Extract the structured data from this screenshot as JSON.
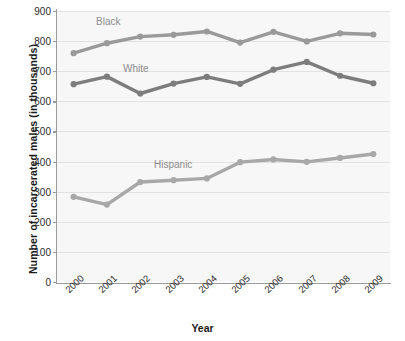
{
  "chart_data": {
    "type": "line",
    "title": "",
    "xlabel": "Year",
    "ylabel": "Number of incarcerated males (in thousands)",
    "categories": [
      "2000",
      "2001",
      "2002",
      "2003",
      "2004",
      "2005",
      "2006",
      "2007",
      "2008",
      "2009"
    ],
    "ylim": [
      0,
      900
    ],
    "ytick_labels": [
      "900",
      "800",
      "700",
      "600",
      "500",
      "400",
      "300",
      "200",
      "100",
      "0"
    ],
    "ytick_values": [
      900,
      800,
      700,
      600,
      500,
      400,
      300,
      200,
      100,
      0
    ],
    "grid": true,
    "legend_position": "inline-labels",
    "series": [
      {
        "name": "Black",
        "color": "#9a9a9a",
        "values": [
          760,
          793,
          815,
          821,
          832,
          795,
          831,
          799,
          826,
          822
        ],
        "label_x": 96,
        "label_y": 16
      },
      {
        "name": "White",
        "color": "#7d7d7d",
        "values": [
          657,
          682,
          626,
          659,
          681,
          658,
          705,
          731,
          685,
          660
        ],
        "label_x": 123,
        "label_y": 63
      },
      {
        "name": "Hispanic",
        "color": "#a8a8a8",
        "values": [
          283,
          257,
          332,
          338,
          344,
          398,
          407,
          399,
          412,
          425
        ],
        "label_x": 154,
        "label_y": 159
      }
    ]
  },
  "axis": {
    "x_title": "Year",
    "y_title": "Number of incarcerated males (in thousands)"
  }
}
